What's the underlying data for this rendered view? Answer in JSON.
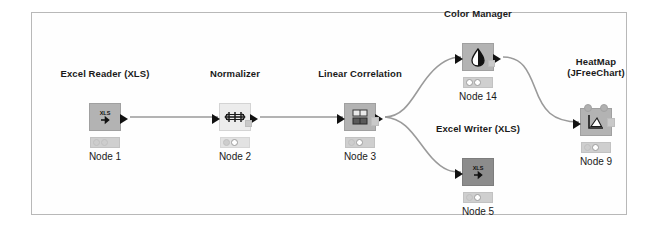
{
  "canvas": {
    "name": "knime-workflow-canvas",
    "background": "#fefefe",
    "border_color": "#b8b8b8"
  },
  "nodes": [
    {
      "id": "node1",
      "title": "Excel Reader (XLS)",
      "label": "Node 1",
      "icon": "xls-read-icon",
      "icon_text": "XLS",
      "body_color": "#b3b3b3",
      "status": [
        "off",
        "off",
        "off"
      ],
      "x": 105,
      "y": 103
    },
    {
      "id": "node2",
      "title": "Normalizer",
      "label": "Node 2",
      "icon": "normalizer-icon",
      "body_color": "#ececec",
      "status": [
        "off",
        "on",
        "off"
      ],
      "x": 235,
      "y": 103
    },
    {
      "id": "node3",
      "title": "Linear Correlation",
      "label": "Node 3",
      "icon": "linear-correlation-icon",
      "body_color": "#b3b3b3",
      "status": [
        "off",
        "on",
        "off"
      ],
      "x": 360,
      "y": 103
    },
    {
      "id": "node14",
      "title": "Color Manager",
      "label": "Node 14",
      "icon": "color-droplet-icon",
      "body_color": "#b3b3b3",
      "status": [
        "on",
        "on",
        "off"
      ],
      "x": 478,
      "y": 43
    },
    {
      "id": "node5",
      "title": "Excel Writer (XLS)",
      "label": "Node 5",
      "icon": "xls-write-icon",
      "icon_text": "XLS",
      "body_color": "#8c8c8c",
      "status": [
        "off",
        "on",
        "off"
      ],
      "x": 478,
      "y": 158
    },
    {
      "id": "node9",
      "title_line1": "HeatMap",
      "title_line2": "(JFreeChart)",
      "title": "HeatMap (JFreeChart)",
      "label": "Node 9",
      "icon": "heatmap-chart-icon",
      "body_color": "#b3b3b3",
      "status": [
        "off",
        "on",
        "off"
      ],
      "x": 596,
      "y": 108
    }
  ],
  "connections": [
    {
      "name": "edge-node1-to-node2",
      "from": "node1",
      "to": "node2"
    },
    {
      "name": "edge-node2-to-node3",
      "from": "node2",
      "to": "node3"
    },
    {
      "name": "edge-node3-to-node14",
      "from": "node3",
      "to": "node14"
    },
    {
      "name": "edge-node3-to-node5",
      "from": "node3",
      "to": "node5"
    },
    {
      "name": "edge-node14-to-node9",
      "from": "node14",
      "to": "node9"
    }
  ],
  "colors": {
    "edge": "#9a9a9a",
    "port": "#111111",
    "text": "#1a1a1a"
  }
}
